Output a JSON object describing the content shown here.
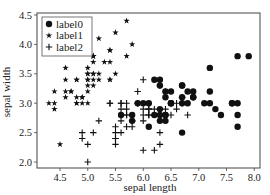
{
  "chart_data": {
    "type": "scatter",
    "title": "",
    "xlabel": "sepal length",
    "ylabel": "sepal width",
    "xlim": [
      4.2,
      8.13
    ],
    "ylim": [
      1.9,
      4.55
    ],
    "xticks": [
      "4.5",
      "5.0",
      "5.5",
      "6.0",
      "6.5",
      "7.0",
      "7.5",
      "8.0"
    ],
    "yticks": [
      "2.0",
      "2.5",
      "3.0",
      "3.5",
      "4.0",
      "4.5"
    ],
    "grid": false,
    "legend_position": "upper left",
    "series": [
      {
        "name": "label0",
        "marker": "circle",
        "points": [
          [
            6.3,
            3.3
          ],
          [
            5.8,
            2.7
          ],
          [
            7.1,
            3.0
          ],
          [
            6.3,
            2.9
          ],
          [
            6.5,
            3.0
          ],
          [
            7.6,
            3.0
          ],
          [
            7.3,
            2.9
          ],
          [
            6.7,
            2.5
          ],
          [
            7.2,
            3.6
          ],
          [
            6.5,
            3.2
          ],
          [
            6.4,
            2.7
          ],
          [
            6.8,
            3.0
          ],
          [
            5.8,
            2.8
          ],
          [
            6.4,
            3.2
          ],
          [
            6.5,
            3.0
          ],
          [
            7.7,
            3.8
          ],
          [
            7.7,
            2.6
          ],
          [
            6.9,
            3.2
          ],
          [
            5.6,
            2.8
          ],
          [
            7.7,
            2.8
          ],
          [
            6.3,
            2.7
          ],
          [
            6.7,
            3.3
          ],
          [
            7.2,
            3.2
          ],
          [
            6.2,
            2.8
          ],
          [
            6.1,
            3.0
          ],
          [
            6.4,
            2.8
          ],
          [
            7.2,
            3.0
          ],
          [
            7.4,
            2.8
          ],
          [
            7.9,
            3.8
          ],
          [
            6.4,
            2.8
          ],
          [
            6.3,
            2.8
          ],
          [
            6.1,
            2.6
          ],
          [
            7.7,
            3.0
          ],
          [
            6.3,
            3.4
          ],
          [
            6.4,
            3.1
          ],
          [
            6.0,
            3.0
          ],
          [
            6.9,
            3.1
          ],
          [
            6.7,
            3.1
          ],
          [
            6.9,
            3.1
          ],
          [
            6.8,
            3.2
          ],
          [
            6.7,
            3.3
          ],
          [
            6.7,
            3.0
          ],
          [
            6.5,
            3.0
          ],
          [
            6.2,
            3.4
          ],
          [
            5.9,
            3.0
          ],
          [
            7.6,
            3.0
          ]
        ]
      },
      {
        "name": "label1",
        "marker": "star",
        "points": [
          [
            5.1,
            3.5
          ],
          [
            4.9,
            3.0
          ],
          [
            4.7,
            3.2
          ],
          [
            4.6,
            3.1
          ],
          [
            5.0,
            3.6
          ],
          [
            5.4,
            3.9
          ],
          [
            4.6,
            3.4
          ],
          [
            5.0,
            3.4
          ],
          [
            4.4,
            2.9
          ],
          [
            4.9,
            3.1
          ],
          [
            5.4,
            3.7
          ],
          [
            4.8,
            3.4
          ],
          [
            4.8,
            3.0
          ],
          [
            4.3,
            3.0
          ],
          [
            5.8,
            4.0
          ],
          [
            5.7,
            4.4
          ],
          [
            5.4,
            3.9
          ],
          [
            5.1,
            3.5
          ],
          [
            5.7,
            3.8
          ],
          [
            5.1,
            3.8
          ],
          [
            5.4,
            3.4
          ],
          [
            5.1,
            3.7
          ],
          [
            4.6,
            3.6
          ],
          [
            5.1,
            3.3
          ],
          [
            4.8,
            3.4
          ],
          [
            5.0,
            3.0
          ],
          [
            5.0,
            3.4
          ],
          [
            5.2,
            3.5
          ],
          [
            5.2,
            3.4
          ],
          [
            4.7,
            3.2
          ],
          [
            4.8,
            3.1
          ],
          [
            5.4,
            3.4
          ],
          [
            5.2,
            4.1
          ],
          [
            5.5,
            4.2
          ],
          [
            4.9,
            3.1
          ],
          [
            5.0,
            3.2
          ],
          [
            5.5,
            3.5
          ],
          [
            4.4,
            3.0
          ],
          [
            5.1,
            3.4
          ],
          [
            5.0,
            3.5
          ],
          [
            4.5,
            2.3
          ],
          [
            4.4,
            3.2
          ],
          [
            5.0,
            3.5
          ],
          [
            5.1,
            3.8
          ],
          [
            4.8,
            3.0
          ],
          [
            5.1,
            3.8
          ],
          [
            4.6,
            3.2
          ],
          [
            5.3,
            3.7
          ],
          [
            5.0,
            3.3
          ]
        ]
      },
      {
        "name": "label2",
        "marker": "plus",
        "points": [
          [
            6.4,
            3.2
          ],
          [
            6.9,
            3.1
          ],
          [
            5.5,
            2.3
          ],
          [
            6.5,
            2.8
          ],
          [
            5.7,
            2.8
          ],
          [
            6.3,
            3.3
          ],
          [
            4.9,
            2.4
          ],
          [
            6.6,
            2.9
          ],
          [
            5.2,
            2.7
          ],
          [
            5.0,
            2.0
          ],
          [
            5.9,
            3.0
          ],
          [
            6.0,
            2.2
          ],
          [
            6.1,
            2.9
          ],
          [
            5.6,
            2.9
          ],
          [
            6.7,
            3.1
          ],
          [
            5.6,
            3.0
          ],
          [
            5.8,
            2.7
          ],
          [
            6.2,
            2.2
          ],
          [
            5.6,
            2.5
          ],
          [
            5.9,
            3.2
          ],
          [
            6.1,
            2.8
          ],
          [
            6.3,
            2.5
          ],
          [
            6.1,
            2.8
          ],
          [
            6.4,
            2.9
          ],
          [
            6.6,
            3.0
          ],
          [
            6.8,
            2.8
          ],
          [
            6.7,
            3.0
          ],
          [
            6.0,
            2.9
          ],
          [
            5.7,
            2.6
          ],
          [
            5.5,
            2.4
          ],
          [
            5.5,
            2.4
          ],
          [
            5.8,
            2.7
          ],
          [
            6.0,
            2.7
          ],
          [
            5.4,
            3.0
          ],
          [
            6.0,
            3.4
          ],
          [
            6.7,
            3.1
          ],
          [
            6.3,
            2.3
          ],
          [
            5.6,
            3.0
          ],
          [
            5.5,
            2.5
          ],
          [
            5.5,
            2.6
          ],
          [
            6.1,
            3.0
          ],
          [
            5.8,
            2.6
          ],
          [
            5.0,
            2.3
          ],
          [
            5.6,
            2.7
          ],
          [
            5.7,
            3.0
          ],
          [
            5.7,
            2.9
          ],
          [
            6.2,
            2.9
          ],
          [
            5.1,
            2.5
          ],
          [
            5.7,
            2.8
          ],
          [
            4.9,
            2.5
          ],
          [
            6.0,
            2.8
          ],
          [
            5.9,
            3.0
          ],
          [
            6.1,
            2.9
          ],
          [
            5.4,
            3.0
          ]
        ]
      }
    ]
  }
}
